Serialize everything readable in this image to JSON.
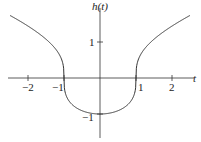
{
  "chart_data": {
    "type": "line",
    "title": "",
    "xlabel": "t",
    "ylabel": "h(t)",
    "xlim": [
      -2.5,
      2.5
    ],
    "ylim": [
      -1.5,
      2
    ],
    "grid": false,
    "x_ticks": [
      "-2",
      "-1",
      "1",
      "2"
    ],
    "y_ticks": [
      "1",
      "-1"
    ],
    "series": [
      {
        "name": "h(t)",
        "x": [
          -2.5,
          -2,
          -1.5,
          -1.1,
          -1,
          -0.9,
          -0.5,
          0,
          0.5,
          0.9,
          1,
          1.1,
          1.5,
          2,
          2.5
        ],
        "values": [
          1.74,
          1.44,
          1.08,
          0.59,
          0,
          -0.57,
          -0.91,
          -1,
          -0.91,
          -0.57,
          0,
          0.59,
          1.08,
          1.44,
          1.74
        ]
      }
    ]
  },
  "labels": {
    "x_axis": "t",
    "y_axis": "h(t)",
    "xt_m2": "−2",
    "xt_m1": "−1",
    "xt_1": "1",
    "xt_2": "2",
    "yt_1": "1",
    "yt_m1": "−1"
  }
}
